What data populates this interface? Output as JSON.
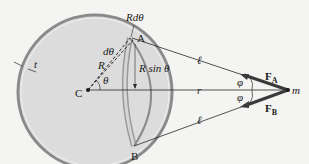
{
  "diagram": {
    "type": "physics-free-body",
    "colors": {
      "background": "#f4f4f2",
      "shell_fill": "#dcdcdc",
      "shell_edge": "#8a8a8a",
      "ring": "#bdbdbd",
      "lines": "#2a2a2a",
      "force_arrow": "#3a3a3a"
    },
    "labels": {
      "R_dtheta": "Rdθ",
      "point_A": "A",
      "point_B": "B",
      "d_theta": "dθ",
      "R": "R",
      "theta": "θ",
      "center": "C",
      "thickness": "t",
      "R_sin_theta": "R sin θ",
      "ell_top": "ℓ",
      "ell_bottom": "ℓ",
      "r": "r",
      "phi_top": "φ",
      "phi_bottom": "φ",
      "F_A": "F",
      "F_A_sub": "A",
      "F_B": "F",
      "F_B_sub": "B",
      "mass": "m"
    }
  }
}
